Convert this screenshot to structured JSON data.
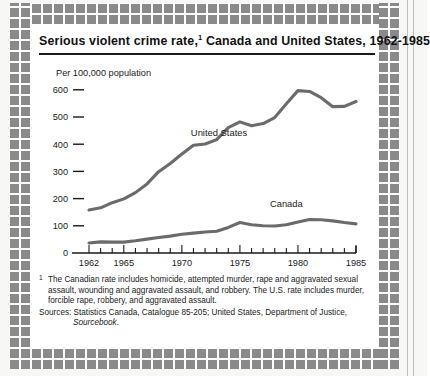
{
  "figure": {
    "title_main": "Serious violent crime rate,",
    "title_footnote_marker": "1",
    "title_rest": " Canada and United States, 1962-1985",
    "axis_caption": "Per 100,000 population",
    "footnote_marker": "1",
    "footnote_text": "The Canadian rate includes homicide, attempted murder, rape and aggravated sexual assault, wounding and aggravated assault, and robbery. The U.S. rate includes murder, forcible rape, robbery, and aggravated assault.",
    "sources_text": "Sources: Statistics Canada, Catalogue 85-205; United States, Department of Justice,",
    "sources_italic": "Sourcebook."
  },
  "colors": {
    "line": "#6b6b6b",
    "axis": "#1a1a1a",
    "frame": "#8a8a8a",
    "paper": "#ffffff",
    "page": "#f7f7f5"
  },
  "chart_data": {
    "type": "line",
    "xlabel": "",
    "ylabel": "Per 100,000 population",
    "ylim": [
      0,
      640
    ],
    "xlim": [
      1962,
      1985
    ],
    "grid": false,
    "legend_position": "inline-labels",
    "ytick_values": [
      0,
      100,
      200,
      300,
      400,
      500,
      600
    ],
    "ytick_labels": [
      "0",
      "100",
      "200",
      "300",
      "400",
      "500",
      "600"
    ],
    "x": [
      1962,
      1963,
      1964,
      1965,
      1966,
      1967,
      1968,
      1969,
      1970,
      1971,
      1972,
      1973,
      1974,
      1975,
      1976,
      1977,
      1978,
      1979,
      1980,
      1981,
      1982,
      1983,
      1984,
      1985
    ],
    "xtick_values": [
      1962,
      1963,
      1964,
      1965,
      1966,
      1967,
      1968,
      1969,
      1970,
      1971,
      1972,
      1973,
      1974,
      1975,
      1976,
      1977,
      1978,
      1979,
      1980,
      1981,
      1982,
      1983,
      1984,
      1985
    ],
    "xtick_labels_shown": [
      "1962",
      "1965",
      "1970",
      "1975",
      "1980",
      "1985"
    ],
    "xtick_labels_shown_values": [
      1962,
      1965,
      1970,
      1975,
      1980,
      1985
    ],
    "series": [
      {
        "name": "United States",
        "label": "United States",
        "label_x": 1973.2,
        "label_y": 430,
        "values": [
          158,
          166,
          185,
          199,
          222,
          254,
          299,
          329,
          364,
          396,
          401,
          417,
          461,
          482,
          468,
          476,
          498,
          549,
          597,
          594,
          571,
          538,
          539,
          557
        ]
      },
      {
        "name": "Canada",
        "label": "Canada",
        "label_x": 1979.0,
        "label_y": 168,
        "values": [
          37,
          41,
          40,
          40,
          45,
          51,
          57,
          62,
          69,
          73,
          77,
          80,
          94,
          112,
          104,
          100,
          99,
          104,
          114,
          123,
          122,
          118,
          112,
          107
        ]
      }
    ]
  }
}
